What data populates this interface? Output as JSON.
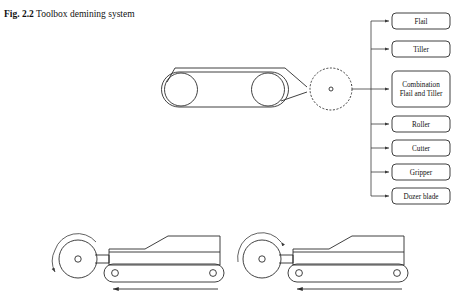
{
  "figure": {
    "label": "Fig. 2.2",
    "caption": "Toolbox demining system"
  },
  "tools": {
    "heading_note": "Interchangeable demining tool attachments",
    "items": [
      {
        "id": "flail",
        "label": "Flail",
        "line2": ""
      },
      {
        "id": "tiller",
        "label": "Tiller",
        "line2": ""
      },
      {
        "id": "combination",
        "label": "Combination",
        "line2": "Flail and Tiller"
      },
      {
        "id": "roller",
        "label": "Roller",
        "line2": ""
      },
      {
        "id": "cutter",
        "label": "Cutter",
        "line2": ""
      },
      {
        "id": "gripper",
        "label": "Gripper",
        "line2": ""
      },
      {
        "id": "dozer-blade",
        "label": "Dozer blade",
        "line2": ""
      }
    ]
  },
  "carrier": {
    "name": "tracked-carrier-vehicle",
    "attachment_point": "dashed-circle-tool-interface"
  },
  "operation_views": [
    {
      "id": "view-left",
      "name": "counter-rotation-operation",
      "rotation": "counter-clockwise",
      "travel_direction": "left"
    },
    {
      "id": "view-right",
      "name": "forward-rotation-operation",
      "rotation": "clockwise",
      "travel_direction": "left"
    }
  ],
  "colors": {
    "line": "#2b2b2b",
    "text": "#111111",
    "background": "#ffffff"
  }
}
